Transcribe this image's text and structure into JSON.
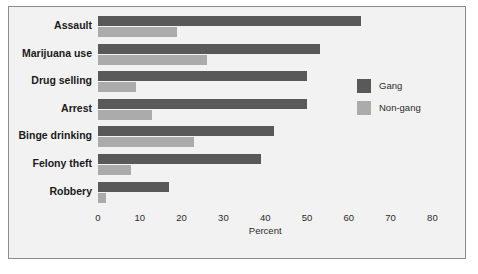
{
  "chart_data": {
    "type": "bar",
    "orientation": "horizontal",
    "title": "",
    "xlabel": "Percent",
    "ylabel": "",
    "xlim": [
      0,
      85
    ],
    "grid": false,
    "legend_position": "right",
    "xticks": [
      "0",
      "10",
      "20",
      "30",
      "40",
      "50",
      "60",
      "70",
      "80"
    ],
    "categories": [
      "Assault",
      "Marijuana use",
      "Drug selling",
      "Arrest",
      "Binge drinking",
      "Felony theft",
      "Robbery"
    ],
    "series": [
      {
        "name": "Gang",
        "color": "#595959",
        "values": [
          63,
          53,
          50,
          50,
          42,
          39,
          17
        ]
      },
      {
        "name": "Non-gang",
        "color": "#ababab",
        "values": [
          19,
          26,
          9,
          13,
          23,
          8,
          2
        ]
      }
    ]
  },
  "colors": {
    "panel_background": "#f2f2f2",
    "panel_border": "#8d8d8d",
    "gang": "#595959",
    "nongang": "#ababab",
    "text": "#1a1a1a"
  }
}
